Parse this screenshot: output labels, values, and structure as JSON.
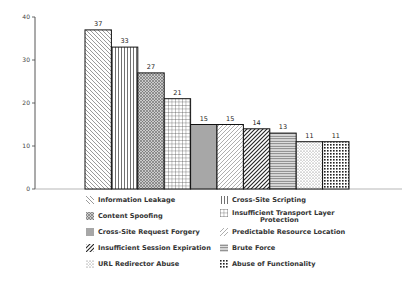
{
  "chart_data": {
    "type": "bar",
    "title": "",
    "xlabel": "",
    "ylabel": "",
    "ylim": [
      0,
      40
    ],
    "yticks": [
      0,
      10,
      20,
      30,
      40
    ],
    "grid": false,
    "legend_position": "bottom",
    "categories": [
      "Information Leakage",
      "Cross-Site Scripting",
      "Content Spoofing",
      "Insufficient Transport Layer Protection",
      "Cross-Site Request Forgery",
      "Predictable Resource Location",
      "Insufficient Session Expiration",
      "Brute Force",
      "URL Redirector Abuse",
      "Abuse of Functionality"
    ],
    "values": [
      37,
      33,
      27,
      21,
      15,
      15,
      14,
      13,
      11,
      11
    ],
    "patterns": [
      "diag-back",
      "vertical",
      "dots-dense",
      "grid",
      "fine-vertical",
      "diag-fwd-light",
      "diag-fwd-bold",
      "horizontal",
      "dots-sparse",
      "checker"
    ]
  },
  "legend": {
    "left": [
      {
        "label": "Information Leakage",
        "pattern": "diag-back"
      },
      {
        "label": "Content Spoofing",
        "pattern": "dots-dense"
      },
      {
        "label": "Cross-Site Request Forgery",
        "pattern": "fine-vertical"
      },
      {
        "label": "Insufficient Session Expiration",
        "pattern": "diag-fwd-bold"
      },
      {
        "label": "URL Redirector Abuse",
        "pattern": "dots-sparse"
      }
    ],
    "right": [
      {
        "label": "Cross-Site Scripting",
        "pattern": "vertical"
      },
      {
        "label": "Insufficient Transport Layer",
        "label2": "Protection",
        "pattern": "grid"
      },
      {
        "label": "Predictable Resource Location",
        "pattern": "diag-fwd-light"
      },
      {
        "label": "Brute Force",
        "pattern": "horizontal"
      },
      {
        "label": "Abuse of Functionality",
        "pattern": "checker"
      }
    ]
  }
}
